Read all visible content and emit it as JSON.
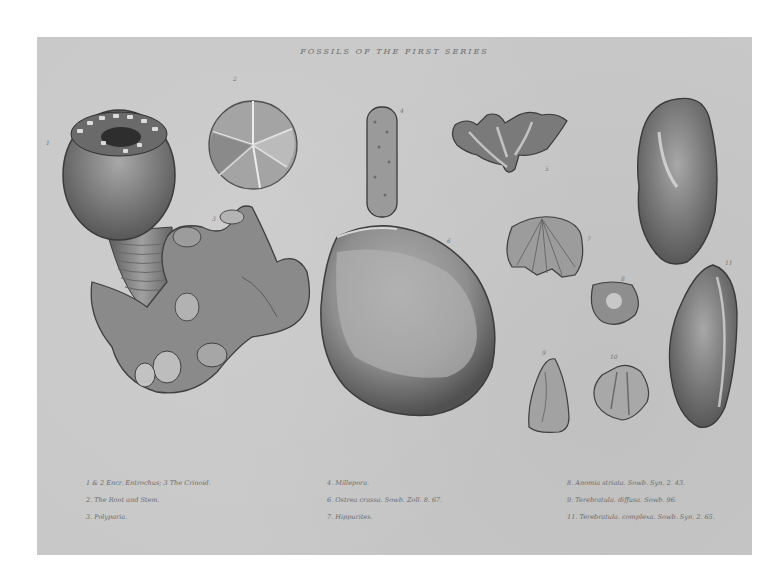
{
  "plate": {
    "title": "FOSSILS OF THE FIRST SERIES",
    "background": "#c8c8c8",
    "page_background": "#ffffff",
    "figure_numbers": [
      "1",
      "2",
      "3",
      "4",
      "5",
      "6",
      "7",
      "8",
      "9",
      "10",
      "11"
    ],
    "specimens": [
      {
        "fig": "1",
        "name": "crinoid-stem-and-cup"
      },
      {
        "fig": "2",
        "name": "radiate-disc"
      },
      {
        "fig": "3",
        "name": "coral-mass"
      },
      {
        "fig": "4",
        "name": "cylindrical-millepore"
      },
      {
        "fig": "5",
        "name": "branching-coral"
      },
      {
        "fig": "6",
        "name": "large-bivalve-shell"
      },
      {
        "fig": "7",
        "name": "ribbed-scallop-shell"
      },
      {
        "fig": "8",
        "name": "small-terebratula"
      },
      {
        "fig": "9",
        "name": "conical-shell"
      },
      {
        "fig": "10",
        "name": "elongate-bivalve-upper"
      },
      {
        "fig": "11",
        "name": "elongate-bivalve-lower"
      }
    ],
    "captions": {
      "left": [
        "1 & 2 Encr. Entrochus; 3 The Crinoid.",
        "2. The Root and Stem.",
        "3. Polyparia."
      ],
      "middle": [
        "4. Millepora.",
        "6. Ostrea crassa. Sowb. Zoll. 8. 67.",
        "7. Hippurites."
      ],
      "right": [
        "8. Anomia striata. Sowb. Syn. 2. 43.",
        "9. Terebratula. diffusa. Sowb. 96.",
        "11. Terebratula. complexa. Sowb. Syn. 2. 65."
      ]
    }
  }
}
